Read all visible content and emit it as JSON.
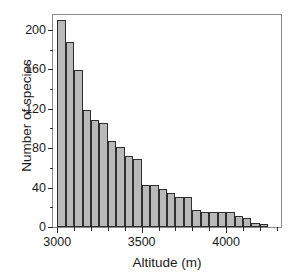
{
  "chart_data": {
    "type": "bar",
    "title": "",
    "subtitle": "",
    "xlabel": "Altitude (m)",
    "ylabel": "Number of species",
    "xlim": [
      2975,
      4325
    ],
    "ylim": [
      0,
      215
    ],
    "grid": false,
    "legend": null,
    "bin_width": 50,
    "x_ticks_major": [
      3000,
      3500,
      4000
    ],
    "x_tick_labels": [
      "3000",
      "3500",
      "4000"
    ],
    "x_ticks_minor": [
      3100,
      3200,
      3300,
      3400,
      3600,
      3700,
      3800,
      3900,
      4100,
      4200,
      4300
    ],
    "y_ticks_major": [
      0,
      40,
      80,
      120,
      160,
      200
    ],
    "y_tick_labels": [
      "0",
      "40",
      "80",
      "120",
      "160",
      "200"
    ],
    "y_ticks_minor": [
      20,
      60,
      100,
      140,
      180
    ],
    "bin_starts": [
      3000,
      3050,
      3100,
      3150,
      3200,
      3250,
      3300,
      3350,
      3400,
      3450,
      3500,
      3550,
      3600,
      3650,
      3700,
      3750,
      3800,
      3850,
      3900,
      3950,
      4000,
      4050,
      4100,
      4150,
      4200
    ],
    "categories": [
      "3000-3050",
      "3050-3100",
      "3100-3150",
      "3150-3200",
      "3200-3250",
      "3250-3300",
      "3300-3350",
      "3350-3400",
      "3400-3450",
      "3450-3500",
      "3500-3550",
      "3550-3600",
      "3600-3650",
      "3650-3700",
      "3700-3750",
      "3750-3800",
      "3800-3850",
      "3850-3900",
      "3900-3950",
      "3950-4000",
      "4000-4050",
      "4050-4100",
      "4100-4150",
      "4150-4200",
      "4200-4250"
    ],
    "values": [
      210,
      188,
      159,
      119,
      109,
      105,
      87,
      81,
      72,
      69,
      43,
      43,
      39,
      34,
      30,
      30,
      17,
      15,
      15,
      15,
      15,
      11,
      9,
      4,
      3
    ],
    "bar_color": "#b9b9b9",
    "bar_edge_color": "#2e2e2e",
    "axis_color": "#2b2b2b",
    "frame_color": "#8a8a8a",
    "text_color": "#1a1a1a"
  }
}
